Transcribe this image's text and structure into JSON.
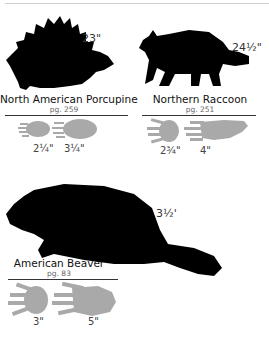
{
  "animals": [
    {
      "name": "North American Porcupine",
      "page": "pg. 259",
      "length": "23\"",
      "tracks": [
        {
          "size": "2¼\""
        },
        {
          "size": "3¼\""
        }
      ]
    },
    {
      "name": "Northern Raccoon",
      "page": "pg. 251",
      "length": "24½\"",
      "tracks": [
        {
          "size": "2¾\""
        },
        {
          "size": "4\""
        }
      ]
    },
    {
      "name": "American Beaver",
      "page": "pg. 83",
      "length": "3½'",
      "tracks": [
        {
          "size": "3\""
        },
        {
          "size": "5\""
        }
      ]
    }
  ],
  "colors": {
    "silhouette": "#000000",
    "track": "#a9a9a9",
    "rule": "#333333"
  }
}
